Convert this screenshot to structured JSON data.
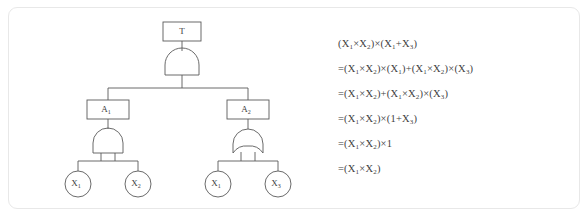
{
  "figure": {
    "type": "fault-tree-with-boolean-reduction",
    "background": "#ffffff",
    "border_color": "#e8e8e8",
    "line_color": "#5a5a5a",
    "text_color": "#3f3f3f"
  },
  "tree": {
    "top_event": {
      "label": "T",
      "shape": "rectangle"
    },
    "gates": [
      {
        "id": "gate-top",
        "type": "AND",
        "parent": "T",
        "children": [
          "A1",
          "A2"
        ]
      },
      {
        "id": "gate-a1",
        "type": "AND",
        "parent": "A1",
        "children": [
          "X1-left",
          "X2-left"
        ]
      },
      {
        "id": "gate-a2",
        "type": "OR",
        "parent": "A2",
        "children": [
          "X1-right",
          "X3-right"
        ]
      }
    ],
    "intermediate_events": [
      {
        "id": "A1",
        "label": "A",
        "subscript": "1",
        "shape": "rectangle"
      },
      {
        "id": "A2",
        "label": "A",
        "subscript": "2",
        "shape": "rectangle"
      }
    ],
    "basic_events": [
      {
        "id": "X1-left",
        "label": "X",
        "subscript": "1",
        "shape": "circle"
      },
      {
        "id": "X2-left",
        "label": "X",
        "subscript": "2",
        "shape": "circle"
      },
      {
        "id": "X1-right",
        "label": "X",
        "subscript": "1",
        "shape": "circle"
      },
      {
        "id": "X3-right",
        "label": "X",
        "subscript": "3",
        "shape": "circle"
      }
    ]
  },
  "equations": [
    {
      "id": "eq-1",
      "parts": [
        {
          "t": "(X"
        },
        {
          "sub": "1"
        },
        {
          "t": "×X"
        },
        {
          "sub": "2"
        },
        {
          "t": ")×(X"
        },
        {
          "sub": "1"
        },
        {
          "t": "+X"
        },
        {
          "sub": "3"
        },
        {
          "t": ")"
        }
      ]
    },
    {
      "id": "eq-2",
      "parts": [
        {
          "t": "=(X"
        },
        {
          "sub": "1"
        },
        {
          "t": "×X"
        },
        {
          "sub": "2"
        },
        {
          "t": ")×(X"
        },
        {
          "sub": "1"
        },
        {
          "t": ")+(X"
        },
        {
          "sub": "1"
        },
        {
          "t": "×X"
        },
        {
          "sub": "2"
        },
        {
          "t": ")×(X"
        },
        {
          "sub": "3"
        },
        {
          "t": ")"
        }
      ]
    },
    {
      "id": "eq-3",
      "parts": [
        {
          "t": "=(X"
        },
        {
          "sub": "1"
        },
        {
          "t": "×X"
        },
        {
          "sub": "2"
        },
        {
          "t": ")+(X"
        },
        {
          "sub": "1"
        },
        {
          "t": "×X"
        },
        {
          "sub": "2"
        },
        {
          "t": ")×(X"
        },
        {
          "sub": "3"
        },
        {
          "t": ")"
        }
      ]
    },
    {
      "id": "eq-4",
      "parts": [
        {
          "t": "=(X"
        },
        {
          "sub": "1"
        },
        {
          "t": "×X"
        },
        {
          "sub": "2"
        },
        {
          "t": ")×(1+X"
        },
        {
          "sub": "3"
        },
        {
          "t": ")"
        }
      ]
    },
    {
      "id": "eq-5",
      "parts": [
        {
          "t": "=(X"
        },
        {
          "sub": "1"
        },
        {
          "t": "×X"
        },
        {
          "sub": "2"
        },
        {
          "t": ")×1"
        }
      ]
    },
    {
      "id": "eq-6",
      "parts": [
        {
          "t": "=(X"
        },
        {
          "sub": "1"
        },
        {
          "t": "×X"
        },
        {
          "sub": "2"
        },
        {
          "t": ")"
        }
      ]
    }
  ]
}
